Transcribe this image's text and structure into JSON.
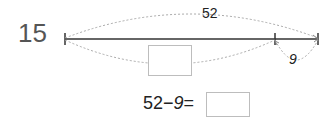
{
  "problem": {
    "number": "15",
    "total_label": "52",
    "part_label": "9",
    "unknown_box": "",
    "equation": {
      "left": "52",
      "operator": "−",
      "right": "9",
      "equals": "=",
      "answer": ""
    }
  },
  "colors": {
    "line": "#333333",
    "arc": "#aaaaaa",
    "box_border": "#bdbdbd",
    "number": "#555555"
  }
}
